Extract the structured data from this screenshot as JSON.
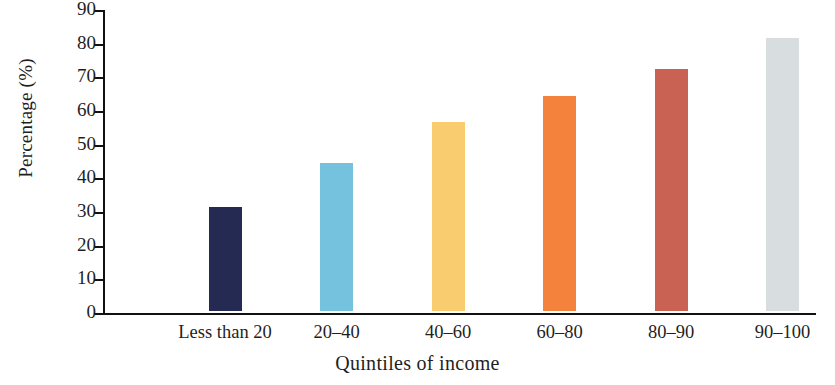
{
  "chart_data": {
    "type": "bar",
    "title": "",
    "xlabel": "Quintiles of income",
    "ylabel": "Percentage (%)",
    "categories": [
      "Less than 20",
      "20–40",
      "40–60",
      "60–80",
      "80–90",
      "90–100"
    ],
    "values": [
      31,
      44,
      56,
      64,
      72,
      81
    ],
    "series": [
      {
        "name": "Percentage",
        "values": [
          31,
          44,
          56,
          64,
          72,
          81
        ]
      }
    ],
    "bar_colors": [
      "#252a52",
      "#74c2dd",
      "#f9cd6f",
      "#f4813c",
      "#c96252",
      "#d8dde0"
    ],
    "ylim": [
      0,
      90
    ],
    "ytick_labels": [
      "0",
      "10",
      "20",
      "30",
      "40",
      "50",
      "60",
      "70",
      "80",
      "90"
    ],
    "ytick_values": [
      0,
      10,
      20,
      30,
      40,
      50,
      60,
      70,
      80,
      90
    ],
    "grid": false,
    "legend": "none",
    "axis_color": "#111111",
    "background": "#ffffff"
  }
}
